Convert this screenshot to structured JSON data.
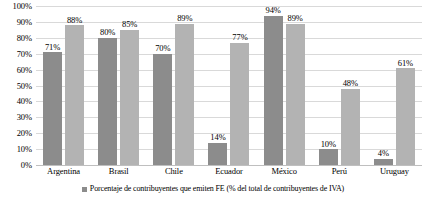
{
  "chart_data": {
    "type": "bar",
    "title": "",
    "subtitle": "",
    "xlabel": "",
    "ylabel": "",
    "categories": [
      "Argentina",
      "Brasil",
      "Chile",
      "Ecuador",
      "México",
      "Perú",
      "Uruguay"
    ],
    "series": [
      {
        "name": "Porcentaje de contribuyentes que emiten FE (% del total de contribuyentes de IVA)",
        "color": "#8c8c8c",
        "values": [
          71,
          80,
          70,
          14,
          94,
          10,
          4
        ],
        "labels": [
          "71%",
          "80%",
          "70%",
          "14%",
          "94%",
          "10%",
          "4%"
        ]
      },
      {
        "name": "",
        "color": "#b3b3b3",
        "values": [
          88,
          85,
          89,
          77,
          89,
          48,
          61
        ],
        "labels": [
          "88%",
          "85%",
          "89%",
          "77%",
          "89%",
          "48%",
          "61%"
        ]
      }
    ],
    "ylim": [
      0,
      100
    ],
    "ytick_values": [
      100,
      90,
      80,
      70,
      60,
      50,
      40,
      30,
      20,
      10,
      0
    ],
    "ytick_labels": [
      "100%",
      "90%",
      "80%",
      "70%",
      "60%",
      "50%",
      "40%",
      "30%",
      "20%",
      "10%",
      "0%"
    ],
    "grid": true,
    "grid_axis": "y",
    "legend_position": "bottom"
  },
  "legend": {
    "swatch_icon": "legend-square-icon",
    "entries": [
      {
        "label": "Porcentaje de contribuyentes que emiten FE (% del total de contribuyentes de IVA)"
      }
    ]
  }
}
